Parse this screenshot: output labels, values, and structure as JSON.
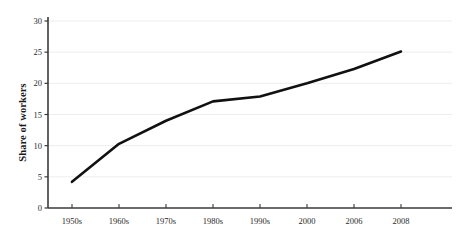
{
  "chart_data": {
    "type": "line",
    "title": "",
    "xlabel": "",
    "ylabel": "Share of workers",
    "categories": [
      "1950s",
      "1960s",
      "1970s",
      "1980s",
      "1990s",
      "2000",
      "2006",
      "2008"
    ],
    "values": [
      4.2,
      10.3,
      14.0,
      17.1,
      17.9,
      20.0,
      22.3,
      25.1
    ],
    "ylim": [
      0,
      30
    ],
    "yticks": [
      0,
      5,
      10,
      15,
      20,
      25,
      30
    ],
    "ytick_labels": [
      "0",
      "5",
      "10",
      "15",
      "20",
      "25",
      "30"
    ],
    "grid": "horizontal",
    "legend": "none",
    "series": [
      {
        "name": "Share of workers",
        "values": [
          4.2,
          10.3,
          14.0,
          17.1,
          17.9,
          20.0,
          22.3,
          25.1
        ]
      }
    ],
    "annotations": []
  },
  "style": {
    "background": "#ffffff",
    "line_color": "#111111",
    "grid_color": "#ededed",
    "axis_color": "#3a3a3a",
    "text_color": "#2b2b2b",
    "line_width": 2.6
  },
  "axis": {
    "y_label": "Share of workers"
  }
}
